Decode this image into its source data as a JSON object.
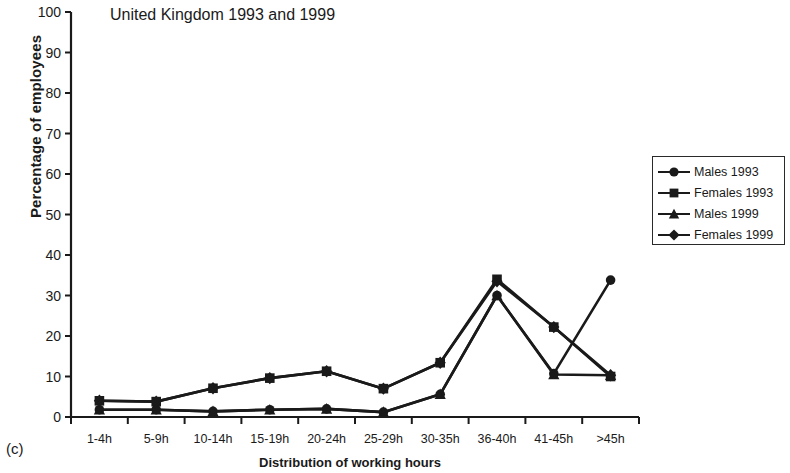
{
  "panel": {
    "label": "(c)"
  },
  "legend": {
    "position": "right",
    "entries": [
      {
        "label": "Males 1993",
        "marker": "circle-marker-icon"
      },
      {
        "label": "Females 1993",
        "marker": "square-marker-icon"
      },
      {
        "label": "Males 1999",
        "marker": "triangle-marker-icon"
      },
      {
        "label": "Females 1999",
        "marker": "diamond-marker-icon"
      }
    ]
  },
  "chart_data": {
    "type": "line",
    "title": "United Kingdom 1993 and 1999",
    "xlabel": "Distribution of working hours",
    "ylabel": "Percentage of employees",
    "categories": [
      "1-4h",
      "5-9h",
      "10-14h",
      "15-19h",
      "20-24h",
      "25-29h",
      "30-35h",
      "36-40h",
      "41-45h",
      ">45h"
    ],
    "ylim": [
      0,
      100
    ],
    "yticks": [
      0,
      10,
      20,
      30,
      40,
      50,
      60,
      70,
      80,
      90,
      100
    ],
    "grid": false,
    "series": [
      {
        "name": "Males 1993",
        "marker": "circle",
        "values": [
          1.8,
          1.8,
          1.4,
          1.8,
          2.0,
          1.2,
          5.6,
          30.0,
          10.7,
          33.8
        ]
      },
      {
        "name": "Females 1993",
        "marker": "square",
        "values": [
          4.0,
          3.8,
          7.1,
          9.6,
          11.3,
          7.0,
          13.4,
          34.0,
          22.2,
          10.0
        ]
      },
      {
        "name": "Males 1999",
        "marker": "triangle",
        "values": [
          1.8,
          1.8,
          1.4,
          1.8,
          2.0,
          1.2,
          5.6,
          30.0,
          10.5,
          10.3
        ]
      },
      {
        "name": "Females 1999",
        "marker": "diamond",
        "values": [
          4.0,
          3.8,
          7.1,
          9.6,
          11.3,
          7.0,
          13.4,
          33.5,
          22.2,
          10.3
        ]
      }
    ]
  }
}
